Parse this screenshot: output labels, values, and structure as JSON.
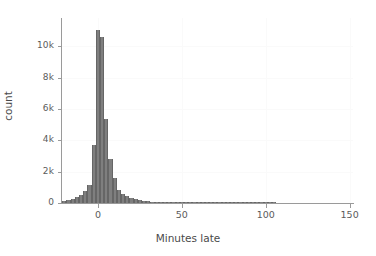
{
  "chart_data": {
    "type": "bar",
    "title": "",
    "subtitle": "",
    "xlabel": "Minutes late",
    "ylabel": "count",
    "xlim": [
      -22,
      152
    ],
    "ylim": [
      0,
      11800
    ],
    "grid": true,
    "legend": null,
    "xticks": [
      0,
      50,
      100,
      150
    ],
    "xtick_labels": [
      "0",
      "50",
      "100",
      "150"
    ],
    "yticks": [
      0,
      2000,
      4000,
      6000,
      8000,
      10000
    ],
    "ytick_labels": [
      "0",
      "2k",
      "4k",
      "6k",
      "8k",
      "10k"
    ],
    "bar_color": "#7f7f7f",
    "bin_width": 2.5,
    "x": [
      -20.0,
      -17.5,
      -15.0,
      -12.5,
      -10.0,
      -7.5,
      -5.0,
      -2.5,
      0.0,
      2.5,
      5.0,
      7.5,
      10.0,
      12.5,
      15.0,
      17.5,
      20.0,
      22.5,
      25.0,
      27.5,
      30.0,
      32.5,
      35.0,
      37.5,
      40.0,
      42.5,
      45.0,
      47.5,
      50.0,
      52.5,
      55.0,
      57.5,
      60.0,
      62.5,
      65.0,
      67.5,
      70.0,
      72.5,
      75.0,
      77.5,
      80.0,
      82.5,
      85.0,
      87.5,
      90.0,
      92.5,
      95.0,
      97.5,
      100.0,
      102.5,
      105.0,
      107.5,
      110.0,
      112.5,
      115.0,
      117.5,
      120.0,
      122.5,
      125.0,
      127.5,
      130.0,
      132.5,
      135.0,
      137.5,
      140.0,
      142.5,
      145.0,
      147.5,
      150.0
    ],
    "categories": [
      "-20",
      "-17.5",
      "-15",
      "-12.5",
      "-10",
      "-7.5",
      "-5",
      "-2.5",
      "0",
      "2.5",
      "5",
      "7.5",
      "10",
      "12.5",
      "15",
      "17.5",
      "20",
      "22.5",
      "25",
      "27.5",
      "30",
      "32.5",
      "35",
      "37.5",
      "40",
      "42.5",
      "45",
      "47.5",
      "50",
      "52.5",
      "55",
      "57.5",
      "60",
      "62.5",
      "65",
      "67.5",
      "70",
      "72.5",
      "75",
      "77.5",
      "80",
      "82.5",
      "85",
      "87.5",
      "90",
      "92.5",
      "95",
      "97.5",
      "100",
      "102.5",
      "105",
      "107.5",
      "110",
      "112.5",
      "115",
      "117.5",
      "120",
      "122.5",
      "125",
      "127.5",
      "130",
      "132.5",
      "135",
      "137.5",
      "140",
      "142.5",
      "145",
      "147.5",
      "150"
    ],
    "values": [
      120,
      180,
      260,
      380,
      520,
      760,
      1150,
      3700,
      11050,
      10600,
      5350,
      2800,
      1600,
      800,
      560,
      430,
      330,
      250,
      190,
      140,
      105,
      80,
      62,
      48,
      38,
      30,
      24,
      19,
      15,
      12,
      10,
      8,
      7,
      6,
      5,
      4,
      4,
      3,
      3,
      2,
      2,
      2,
      2,
      1,
      1,
      1,
      1,
      1,
      1,
      1,
      1,
      0,
      0,
      0,
      0,
      0,
      0,
      0,
      0,
      0,
      0,
      0,
      0,
      0,
      0,
      0,
      0,
      0,
      0
    ],
    "peak_value": 11050,
    "peak_x": 0
  },
  "axes": {
    "y_title": "count",
    "x_title": "Minutes late"
  }
}
